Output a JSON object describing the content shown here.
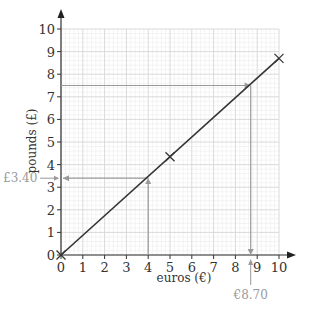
{
  "chart_data": {
    "type": "line",
    "title": "",
    "xlabel": "euros (€)",
    "ylabel": "pounds (£)",
    "xlim": [
      0,
      10
    ],
    "ylim": [
      0,
      10
    ],
    "x_ticks": [
      "0",
      "1",
      "2",
      "3",
      "4",
      "5",
      "6",
      "7",
      "8",
      "9",
      "10"
    ],
    "y_ticks": [
      "0",
      "1",
      "2",
      "3",
      "4",
      "5",
      "6",
      "7",
      "8",
      "9",
      "10"
    ],
    "grid": true,
    "series": [
      {
        "name": "conversion line",
        "x": [
          0,
          5,
          10
        ],
        "y": [
          0,
          4.35,
          8.7
        ],
        "markers": "x",
        "color": "#333333"
      }
    ],
    "annotations": [
      {
        "label": "£3.40",
        "from_x": 4,
        "value_y": 3.4,
        "direction": "euros to pounds"
      },
      {
        "label": "€8.70",
        "from_y": 7.5,
        "value_x": 8.7,
        "direction": "pounds to euros"
      }
    ],
    "colors": {
      "line": "#333333",
      "axis": "#333333",
      "guide": "#999999",
      "major_grid": "#d6d6d6",
      "minor_grid": "#ececec"
    }
  }
}
